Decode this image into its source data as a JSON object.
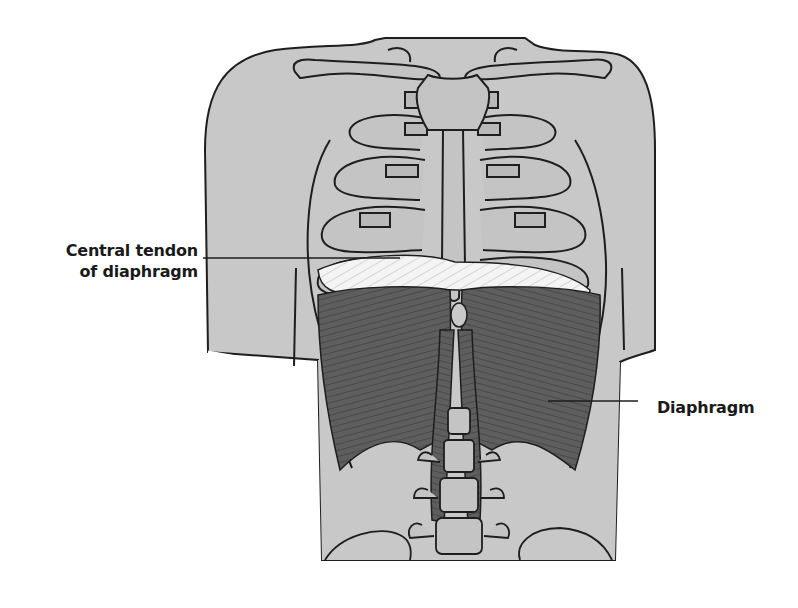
{
  "figure": {
    "colors": {
      "skin": "#c8c8c8",
      "outline": "#1e1e1e",
      "bone": "#c4c4c4",
      "cartilage": "#b9b9b9",
      "muscle": "#5e5e5e",
      "muscle_fiber": "#3a3a3a",
      "tendon": "#f2f2f2",
      "background": "#ffffff"
    }
  },
  "labels": [
    {
      "id": "central-tendon",
      "lines": [
        "Central tendon",
        "of diaphragm"
      ]
    },
    {
      "id": "diaphragm",
      "lines": [
        "Diaphragm"
      ]
    }
  ]
}
